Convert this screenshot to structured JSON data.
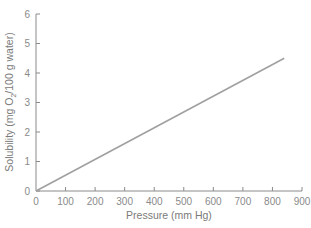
{
  "chart_data": {
    "type": "line",
    "title": "",
    "xlabel": "Pressure (mm Hg)",
    "ylabel": "Solubility (mg O2/100 g water)",
    "ylabel_parts": {
      "before": "Solubility (mg O",
      "sub": "2",
      "after": "/100 g water)"
    },
    "xlim": [
      0,
      900
    ],
    "ylim": [
      0,
      6
    ],
    "xticks": [
      0,
      100,
      200,
      300,
      400,
      500,
      600,
      700,
      800,
      900
    ],
    "yticks": [
      0,
      1,
      2,
      3,
      4,
      5,
      6
    ],
    "grid": false,
    "legend": null,
    "series": [
      {
        "name": "O2 solubility",
        "x": [
          0,
          840
        ],
        "y": [
          0,
          4.5
        ],
        "color": "#a0a0a0"
      }
    ]
  },
  "colors": {
    "axis": "#8a8a8a",
    "line": "#a0a0a0",
    "text": "#7a7a7a"
  }
}
